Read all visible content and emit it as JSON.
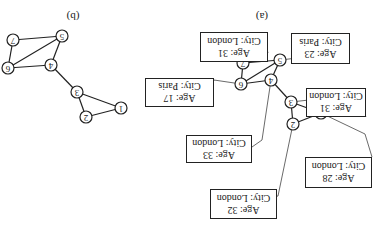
{
  "figure": {
    "orientation": "rotated-180",
    "captions": {
      "a": "(a)",
      "b": "(b)"
    },
    "graph_a": {
      "nodes": [
        {
          "id": "1",
          "x": 321,
          "y": 113
        },
        {
          "id": "2",
          "x": 293,
          "y": 124
        },
        {
          "id": "3",
          "x": 291,
          "y": 102
        },
        {
          "id": "4",
          "x": 271,
          "y": 80
        },
        {
          "id": "5",
          "x": 280,
          "y": 60
        },
        {
          "id": "6",
          "x": 241,
          "y": 84
        },
        {
          "id": "7",
          "x": 243,
          "y": 63
        }
      ],
      "edges": [
        [
          "1",
          "2"
        ],
        [
          "1",
          "3"
        ],
        [
          "2",
          "3"
        ],
        [
          "3",
          "4"
        ],
        [
          "4",
          "5"
        ],
        [
          "4",
          "6"
        ],
        [
          "5",
          "6"
        ],
        [
          "5",
          "7"
        ],
        [
          "6",
          "7"
        ]
      ],
      "attributes": [
        {
          "node": "1",
          "age_label": "Age: 28",
          "city_label": "City: London"
        },
        {
          "node": "2",
          "age_label": "Age: 32",
          "city_label": "City: London"
        },
        {
          "node": "3",
          "age_label": "Age: 31",
          "city_label": "City: London"
        },
        {
          "node": "4",
          "age_label": "Age: 33",
          "city_label": "City: London"
        },
        {
          "node": "5",
          "age_label": "Age: 23",
          "city_label": "City: Paris"
        },
        {
          "node": "6",
          "age_label": "Age: 17",
          "city_label": "City: Paris"
        },
        {
          "node": "7",
          "age_label": "Age: 31",
          "city_label": "City: London"
        }
      ]
    },
    "graph_b": {
      "nodes": [
        {
          "id": "1",
          "x": 121,
          "y": 108
        },
        {
          "id": "2",
          "x": 86,
          "y": 117
        },
        {
          "id": "3",
          "x": 77,
          "y": 92
        },
        {
          "id": "4",
          "x": 51,
          "y": 65
        },
        {
          "id": "5",
          "x": 62,
          "y": 36
        },
        {
          "id": "6",
          "x": 8,
          "y": 68
        },
        {
          "id": "7",
          "x": 13,
          "y": 40
        }
      ],
      "edges": [
        [
          "1",
          "2"
        ],
        [
          "1",
          "3"
        ],
        [
          "2",
          "3"
        ],
        [
          "3",
          "4"
        ],
        [
          "4",
          "5"
        ],
        [
          "4",
          "6"
        ],
        [
          "5",
          "6"
        ],
        [
          "5",
          "7"
        ],
        [
          "6",
          "7"
        ]
      ]
    }
  },
  "labels": {
    "caption_a": "(a)",
    "caption_b": "(b)",
    "node_1": "1",
    "node_2": "2",
    "node_3": "3",
    "node_4": "4",
    "node_5": "5",
    "node_6": "6",
    "node_7": "7",
    "box_1_age": "Age: 28",
    "box_1_city": "City: London",
    "box_2_age": "Age: 32",
    "box_2_city": "City: London",
    "box_3_age": "Age: 31",
    "box_3_city": "City: London",
    "box_4_age": "Age: 33",
    "box_4_city": "City: London",
    "box_5_age": "Age: 23",
    "box_5_city": "City: Paris",
    "box_6_age": "Age: 17",
    "box_6_city": "City: Paris",
    "box_7_age": "Age: 31",
    "box_7_city": "City: London"
  }
}
